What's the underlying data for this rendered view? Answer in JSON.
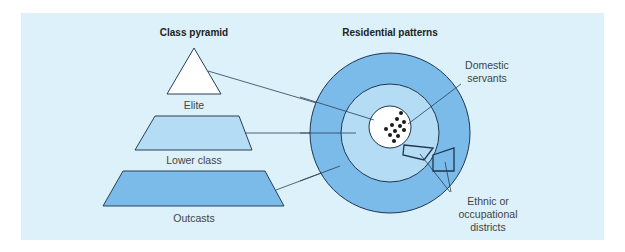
{
  "diagram": {
    "left_title": "Class pyramid",
    "right_title": "Residential patterns",
    "pyramid": [
      {
        "label": "Elite",
        "fill": "#ffffff"
      },
      {
        "label": "Lower class",
        "fill": "#b5dcf5"
      },
      {
        "label": "Outcasts",
        "fill": "#7bbbe9"
      }
    ],
    "callouts": {
      "servants_line1": "Domestic",
      "servants_line2": "servants",
      "districts_line1": "Ethnic or",
      "districts_line2": "occupational",
      "districts_line3": "districts"
    },
    "colors": {
      "background": "#dcf1fa",
      "outer_ring": "#7bbbe9",
      "middle_ring": "#b5dcf5",
      "center": "#ffffff",
      "stroke": "#1f3550"
    }
  }
}
